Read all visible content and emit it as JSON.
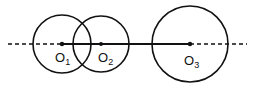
{
  "diagram": {
    "line": {
      "y": 44,
      "dashed_left": [
        8,
        62
      ],
      "solid": [
        62,
        190
      ],
      "dashed_right": [
        190,
        247
      ]
    },
    "circles": [
      {
        "id": "O1",
        "label": "O",
        "subscript": "1",
        "cx": 62,
        "cy": 44,
        "r": 29
      },
      {
        "id": "O2",
        "label": "O",
        "subscript": "2",
        "cx": 101,
        "cy": 44,
        "r": 28
      },
      {
        "id": "O3",
        "label": "O",
        "subscript": "3",
        "cx": 190,
        "cy": 44,
        "r": 38
      }
    ],
    "stroke_color": "#111111"
  }
}
